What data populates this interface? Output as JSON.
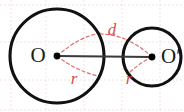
{
  "figure": {
    "canvas": {
      "width": 184,
      "height": 112,
      "background": "#ffffff"
    },
    "colors": {
      "stroke_black": "#111111",
      "measure_red": "#d94a4a",
      "dash_red": "#e06a6a",
      "grid_pink": "#e8c9c9",
      "link_gray": "#3a3a3a"
    },
    "grid": {
      "visible": true,
      "style": "dashed",
      "vertical_x": [
        11,
        46,
        84,
        122,
        160
      ],
      "horizontal_y": [
        5,
        42,
        80,
        110
      ]
    },
    "circles": [
      {
        "name": "large-circle",
        "cx": 57,
        "cy": 56,
        "r": 47,
        "center_label": "O",
        "center_label_x": 38,
        "center_label_y": 57,
        "radius_label": "r",
        "radius_label_x": 74,
        "radius_label_y": 80
      },
      {
        "name": "small-circle",
        "cx": 152,
        "cy": 57,
        "r": 29,
        "center_label": "O′",
        "center_label_x": 161,
        "center_label_y": 58,
        "radius_label": "r",
        "radius_label_x": 129,
        "radius_label_y": 80
      }
    ],
    "center_segment": {
      "name": "center-distance-segment",
      "x1": 57,
      "y1": 56,
      "x2": 152,
      "y2": 57,
      "label": "d",
      "label_x": 112,
      "label_y": 31
    },
    "radius_guides": [
      {
        "name": "large-upper-radius",
        "x1": 57,
        "y1": 56,
        "x2": 101,
        "y2": 33
      },
      {
        "name": "large-lower-radius",
        "x1": 57,
        "y1": 56,
        "x2": 99,
        "y2": 76
      },
      {
        "name": "small-upper-radius",
        "x1": 152,
        "y1": 57,
        "x2": 126,
        "y2": 40
      },
      {
        "name": "small-lower-radius",
        "x1": 152,
        "y1": 57,
        "x2": 128,
        "y2": 74
      },
      {
        "name": "distance-upper-guide",
        "x1": 100,
        "y1": 34,
        "x2": 124,
        "y2": 38
      }
    ]
  }
}
